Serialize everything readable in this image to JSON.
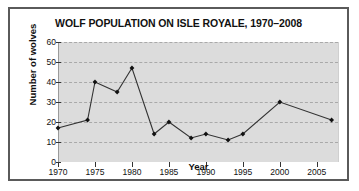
{
  "chart_data": {
    "type": "line",
    "title": "WOLF POPULATION ON ISLE ROYALE, 1970–2008",
    "xlabel": "Year",
    "ylabel": "Number of wolves",
    "xlim": [
      1970,
      2008
    ],
    "ylim": [
      0,
      60
    ],
    "xticks": [
      1970,
      1975,
      1980,
      1985,
      1990,
      1995,
      2000,
      2005
    ],
    "yticks": [
      0,
      10,
      20,
      30,
      40,
      50,
      60
    ],
    "grid": true,
    "legend": "none",
    "marker": "diamond",
    "line_color": "#333333",
    "marker_color": "#111111",
    "plot_bg": "#dcdcdc",
    "x": [
      1970,
      1974,
      1975,
      1978,
      1980,
      1983,
      1985,
      1988,
      1990,
      1993,
      1995,
      2000,
      2007
    ],
    "values": [
      17,
      21,
      40,
      35,
      47,
      14,
      20,
      12,
      14,
      11,
      14,
      30,
      21
    ]
  },
  "axis": {
    "ytick_labels": [
      "60",
      "50",
      "40",
      "30",
      "20",
      "10",
      "0"
    ],
    "xtick_labels": [
      "1970",
      "1975",
      "1980",
      "1985",
      "1990",
      "1995",
      "2000",
      "2005"
    ]
  }
}
